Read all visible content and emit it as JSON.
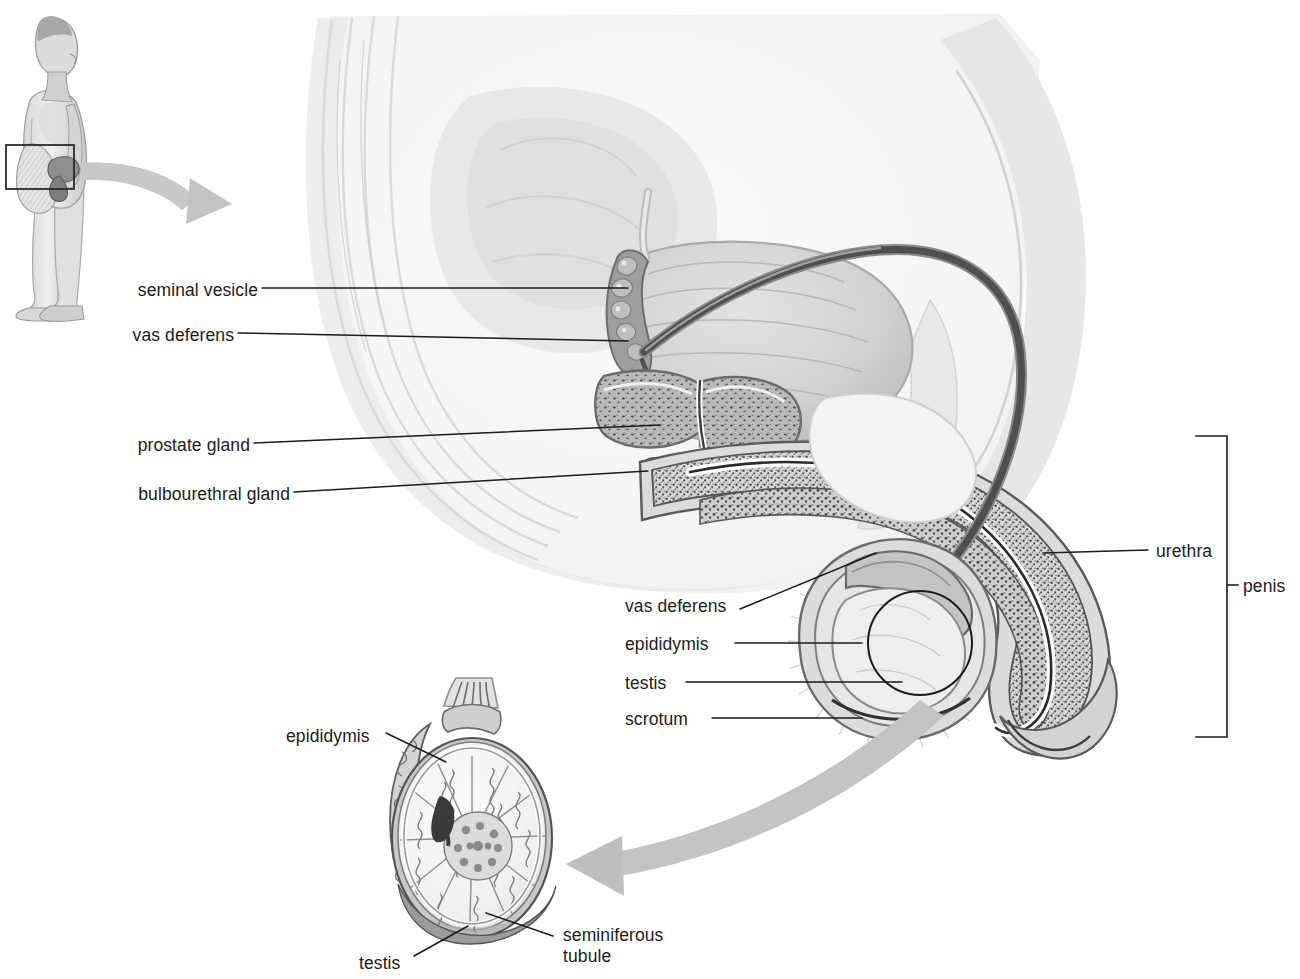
{
  "figure": {
    "kind": "anatomical-diagram",
    "view": "midsagittal section of the male pelvis with testis inset",
    "background_color": "#ffffff",
    "line_color": "#1b1b1b",
    "tissue_tone": "#e9e9e9",
    "arrow_color": "#c2c2c2"
  },
  "labels": {
    "seminal_vesicle": "seminal vesicle",
    "vas_deferens_upper": "vas deferens",
    "prostate_gland": "prostate gland",
    "bulbourethral_gland": "bulbourethral gland",
    "vas_deferens_lower": "vas deferens",
    "epididymis_main": "epididymis",
    "testis_main": "testis",
    "scrotum": "scrotum",
    "urethra": "urethra",
    "penis": "penis",
    "epididymis_inset": "epididymis",
    "testis_inset": "testis",
    "seminiferous_tubule_line1": "seminiferous",
    "seminiferous_tubule_line2": "tubule"
  },
  "callouts": {
    "body_figure": "male body in left profile with pelvic region highlighted",
    "highlight_box": "rectangular locator box over the pelvis",
    "top_arrow": "curved arrow from the body locator box to the pelvic section",
    "bottom_arrow": "curved arrow from the scrotum to the enlarged testis inset",
    "circle_marker": "circular marker on the testis indicating the magnified area"
  },
  "bracket": {
    "name": "penis-extent-bracket",
    "top_y": 436,
    "bottom_y": 737,
    "tick_y": 585
  }
}
